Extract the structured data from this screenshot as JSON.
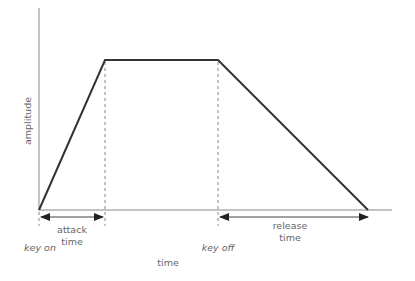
{
  "diagram": {
    "type": "envelope",
    "y_axis_label": "amplitude",
    "x_axis_label": "time",
    "markers": {
      "key_on": "key on",
      "key_off": "key off"
    },
    "spans": {
      "attack": [
        "attack",
        "time"
      ],
      "release": [
        "release",
        "time"
      ]
    },
    "points": [
      {
        "name": "start",
        "x": 39,
        "y": 210
      },
      {
        "name": "attack_peak",
        "x": 105,
        "y": 60
      },
      {
        "name": "key_off",
        "x": 218,
        "y": 60
      },
      {
        "name": "release_end",
        "x": 368,
        "y": 210
      }
    ],
    "colors": {
      "envelope": "#333333",
      "axis": "#888888",
      "dashed": "#888888",
      "text": "#666666"
    }
  }
}
